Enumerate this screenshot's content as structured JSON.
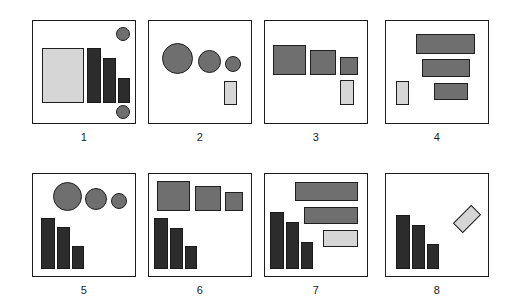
{
  "figure": {
    "width": 506,
    "height": 307,
    "background": "#ffffff",
    "columns": 4,
    "rows": 2,
    "panel_count": 8,
    "palette": {
      "dark_fill": "#2c2c2c",
      "medium_fill": "#6f6f6f",
      "light_fill": "#d6d6d6",
      "outline": "#1d1d1d",
      "background": "#ffffff",
      "label_color": "#1c1c1c"
    }
  },
  "panels": [
    {
      "label": "1",
      "box": {
        "x": 32,
        "y": 20,
        "w": 104,
        "h": 104
      },
      "shapes": [
        {
          "name": "large-light-square",
          "kind": "rect",
          "tone": "light",
          "x": 9,
          "y": 27,
          "w": 42,
          "h": 55
        },
        {
          "name": "dark-bar-1",
          "kind": "rect",
          "tone": "dark",
          "x": 54,
          "y": 27,
          "w": 14,
          "h": 55
        },
        {
          "name": "dark-bar-2",
          "kind": "rect",
          "tone": "dark",
          "x": 70,
          "y": 37,
          "w": 13,
          "h": 45
        },
        {
          "name": "dark-bar-3",
          "kind": "rect",
          "tone": "dark",
          "x": 85,
          "y": 57,
          "w": 12,
          "h": 25
        },
        {
          "name": "circle-top-right",
          "kind": "circle",
          "tone": "medium",
          "x": 83,
          "y": 6,
          "w": 14,
          "h": 14
        },
        {
          "name": "circle-bottom-right",
          "kind": "circle",
          "tone": "medium",
          "x": 83,
          "y": 84,
          "w": 14,
          "h": 14
        }
      ]
    },
    {
      "label": "2",
      "box": {
        "x": 148,
        "y": 20,
        "w": 104,
        "h": 104
      },
      "shapes": [
        {
          "name": "circle-large",
          "kind": "circle",
          "tone": "medium",
          "x": 13,
          "y": 22,
          "w": 31,
          "h": 31
        },
        {
          "name": "circle-medium",
          "kind": "circle",
          "tone": "medium",
          "x": 49,
          "y": 29,
          "w": 23,
          "h": 23
        },
        {
          "name": "circle-small",
          "kind": "circle",
          "tone": "medium",
          "x": 76,
          "y": 35,
          "w": 16,
          "h": 16
        },
        {
          "name": "light-vertical-rect",
          "kind": "rect",
          "tone": "light",
          "x": 75,
          "y": 60,
          "w": 13,
          "h": 24
        }
      ]
    },
    {
      "label": "3",
      "box": {
        "x": 264,
        "y": 20,
        "w": 104,
        "h": 104
      },
      "shapes": [
        {
          "name": "grey-square-large",
          "kind": "rect",
          "tone": "medium",
          "x": 8,
          "y": 24,
          "w": 33,
          "h": 30
        },
        {
          "name": "grey-square-medium",
          "kind": "rect",
          "tone": "medium",
          "x": 45,
          "y": 29,
          "w": 26,
          "h": 25
        },
        {
          "name": "grey-square-small",
          "kind": "rect",
          "tone": "medium",
          "x": 75,
          "y": 36,
          "w": 18,
          "h": 18
        },
        {
          "name": "light-vertical-rect",
          "kind": "rect",
          "tone": "light",
          "x": 75,
          "y": 59,
          "w": 14,
          "h": 25
        }
      ]
    },
    {
      "label": "4",
      "box": {
        "x": 385,
        "y": 20,
        "w": 104,
        "h": 104
      },
      "shapes": [
        {
          "name": "grey-bar-long",
          "kind": "rect",
          "tone": "medium",
          "x": 30,
          "y": 13,
          "w": 59,
          "h": 20
        },
        {
          "name": "grey-bar-medium",
          "kind": "rect",
          "tone": "medium",
          "x": 36,
          "y": 38,
          "w": 48,
          "h": 18
        },
        {
          "name": "grey-bar-short",
          "kind": "rect",
          "tone": "medium",
          "x": 48,
          "y": 62,
          "w": 34,
          "h": 17
        },
        {
          "name": "light-vertical-rect",
          "kind": "rect",
          "tone": "light",
          "x": 10,
          "y": 60,
          "w": 13,
          "h": 24
        }
      ]
    },
    {
      "label": "5",
      "box": {
        "x": 32,
        "y": 173,
        "w": 104,
        "h": 104
      },
      "shapes": [
        {
          "name": "circle-large",
          "kind": "circle",
          "tone": "medium",
          "x": 20,
          "y": 8,
          "w": 29,
          "h": 29
        },
        {
          "name": "circle-medium",
          "kind": "circle",
          "tone": "medium",
          "x": 52,
          "y": 14,
          "w": 22,
          "h": 22
        },
        {
          "name": "circle-small",
          "kind": "circle",
          "tone": "medium",
          "x": 78,
          "y": 19,
          "w": 16,
          "h": 16
        },
        {
          "name": "dark-bar-1",
          "kind": "rect",
          "tone": "dark",
          "x": 8,
          "y": 44,
          "w": 14,
          "h": 51
        },
        {
          "name": "dark-bar-2",
          "kind": "rect",
          "tone": "dark",
          "x": 24,
          "y": 53,
          "w": 13,
          "h": 42
        },
        {
          "name": "dark-bar-3",
          "kind": "rect",
          "tone": "dark",
          "x": 39,
          "y": 72,
          "w": 12,
          "h": 23
        }
      ]
    },
    {
      "label": "6",
      "box": {
        "x": 148,
        "y": 173,
        "w": 104,
        "h": 104
      },
      "shapes": [
        {
          "name": "grey-square-large",
          "kind": "rect",
          "tone": "medium",
          "x": 8,
          "y": 7,
          "w": 33,
          "h": 30
        },
        {
          "name": "grey-square-medium",
          "kind": "rect",
          "tone": "medium",
          "x": 46,
          "y": 12,
          "w": 26,
          "h": 25
        },
        {
          "name": "grey-square-small",
          "kind": "rect",
          "tone": "medium",
          "x": 76,
          "y": 18,
          "w": 18,
          "h": 19
        },
        {
          "name": "dark-bar-1",
          "kind": "rect",
          "tone": "dark",
          "x": 5,
          "y": 44,
          "w": 14,
          "h": 51
        },
        {
          "name": "dark-bar-2",
          "kind": "rect",
          "tone": "dark",
          "x": 21,
          "y": 54,
          "w": 13,
          "h": 41
        },
        {
          "name": "dark-bar-3",
          "kind": "rect",
          "tone": "dark",
          "x": 36,
          "y": 72,
          "w": 12,
          "h": 23
        }
      ]
    },
    {
      "label": "7",
      "box": {
        "x": 264,
        "y": 173,
        "w": 104,
        "h": 104
      },
      "shapes": [
        {
          "name": "grey-bar-long",
          "kind": "rect",
          "tone": "medium",
          "x": 30,
          "y": 8,
          "w": 63,
          "h": 19
        },
        {
          "name": "grey-bar-medium",
          "kind": "rect",
          "tone": "medium",
          "x": 39,
          "y": 33,
          "w": 54,
          "h": 17
        },
        {
          "name": "light-bar-small",
          "kind": "rect",
          "tone": "light",
          "x": 58,
          "y": 56,
          "w": 35,
          "h": 17
        },
        {
          "name": "dark-bar-1",
          "kind": "rect",
          "tone": "dark",
          "x": 5,
          "y": 38,
          "w": 14,
          "h": 57
        },
        {
          "name": "dark-bar-2",
          "kind": "rect",
          "tone": "dark",
          "x": 21,
          "y": 48,
          "w": 13,
          "h": 47
        },
        {
          "name": "dark-bar-3",
          "kind": "rect",
          "tone": "dark",
          "x": 36,
          "y": 68,
          "w": 12,
          "h": 27
        }
      ]
    },
    {
      "label": "8",
      "box": {
        "x": 385,
        "y": 173,
        "w": 104,
        "h": 104
      },
      "shapes": [
        {
          "name": "dark-bar-1",
          "kind": "rect",
          "tone": "dark",
          "x": 10,
          "y": 41,
          "w": 14,
          "h": 54
        },
        {
          "name": "dark-bar-2",
          "kind": "rect",
          "tone": "dark",
          "x": 26,
          "y": 51,
          "w": 13,
          "h": 44
        },
        {
          "name": "dark-bar-3",
          "kind": "rect",
          "tone": "dark",
          "x": 41,
          "y": 70,
          "w": 12,
          "h": 25
        },
        {
          "name": "light-rotated-diamond",
          "kind": "rect",
          "tone": "light",
          "x": 68,
          "y": 38,
          "w": 26,
          "h": 14,
          "rotate": -45
        }
      ]
    }
  ]
}
